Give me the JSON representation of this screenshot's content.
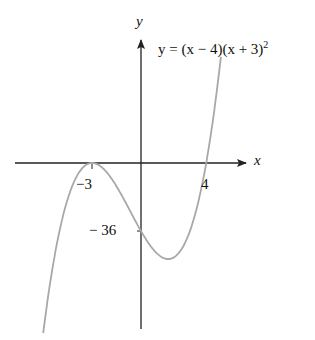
{
  "chart_data": {
    "type": "line",
    "title": "",
    "equation": "y = (x − 4)(x + 3)²",
    "xlabel": "x",
    "ylabel": "y",
    "function": "(x-4)*(x+3)^2",
    "x_range": [
      -6.0,
      4.9
    ],
    "annotations": [
      {
        "label": "−3",
        "x": -3,
        "y": 0,
        "kind": "x-intercept (double root)"
      },
      {
        "label": "4",
        "x": 4,
        "y": 0,
        "kind": "x-intercept"
      },
      {
        "label": "− 36",
        "x": 0,
        "y": -36,
        "kind": "y-intercept"
      }
    ],
    "grid": false,
    "curve_color": "#a8a8a8",
    "axis_color": "#222222"
  },
  "labels": {
    "x_axis": "x",
    "y_axis": "y",
    "eq_prefix": "y = (x − 4)(x + 3)",
    "eq_exp": "2",
    "tick_neg3": "−3",
    "tick_4": "4",
    "tick_neg36": "− 36"
  }
}
